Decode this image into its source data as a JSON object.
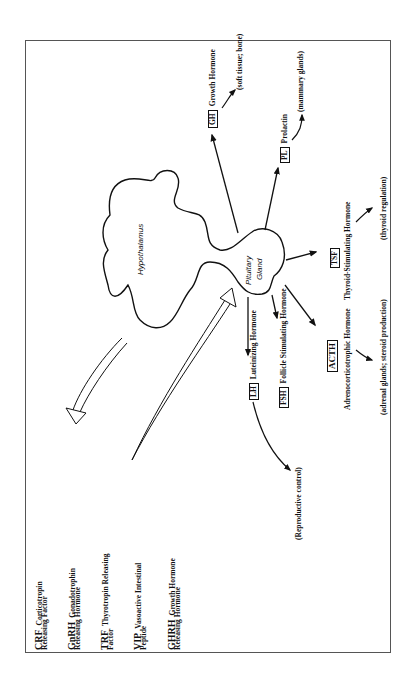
{
  "diagram": {
    "orientation": "rotated -90deg (text reads bottom-to-top)",
    "organs": {
      "hypothalamus": "Hypothalamus",
      "pituitary_line1": "Pituitary",
      "pituitary_line2": "Gland"
    },
    "legend": [
      {
        "abbr": "CRF",
        "line1": "Corticotropin",
        "line2": "Releasing Factor"
      },
      {
        "abbr": "GnRH",
        "line1": "Gonadotrophin",
        "line2": "Releasing Hormone"
      },
      {
        "abbr": "TRF",
        "line1": "Thyrotropin Releasing",
        "line2": "Factor"
      },
      {
        "abbr": "VIP",
        "line1": "Vasoactive Intestinal",
        "line2": "Peptide"
      },
      {
        "abbr": "GHRH",
        "line1": "Growth Hormone",
        "line2": "Releasing Hormone"
      }
    ],
    "hormones": [
      {
        "abbr": "GH",
        "name": "Growth Hormone",
        "target": "(soft tissue; bone)"
      },
      {
        "abbr": "PL",
        "name": "Prolactin",
        "target": "(mammary glands)"
      },
      {
        "abbr": "TSF",
        "name": "Thyroid-Stimulating Hormone",
        "target": "(thyroid regulation)"
      },
      {
        "abbr": "ACTH",
        "name": "Adrenocorticotrophic Hormone",
        "target": "(adrenal glands; steroid production)"
      },
      {
        "abbr": "FSH",
        "name": "Follicle Stimulating Hormone",
        "target": ""
      },
      {
        "abbr": "LH",
        "name": "Luteinizing Hormone",
        "target": "(Reproductive control)"
      }
    ],
    "flows": [
      {
        "from": "hypothalamus",
        "to": "legend",
        "style": "hollow-arrow"
      },
      {
        "from": "legend",
        "to": "pituitary",
        "style": "hollow-arrow"
      }
    ]
  }
}
